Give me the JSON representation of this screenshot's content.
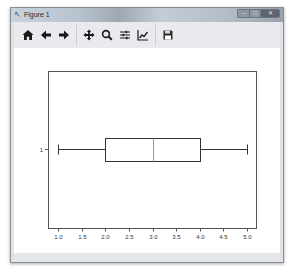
{
  "window": {
    "title": "Figure 1",
    "controls": {
      "minimize": "–",
      "maximize": "□",
      "close": "✕"
    }
  },
  "toolbar": {
    "buttons": [
      {
        "name": "home",
        "icon": "home-icon",
        "group": 0
      },
      {
        "name": "back",
        "icon": "arrow-left-icon",
        "group": 0
      },
      {
        "name": "forward",
        "icon": "arrow-right-icon",
        "group": 0
      },
      {
        "name": "pan",
        "icon": "move-icon",
        "group": 1
      },
      {
        "name": "zoom",
        "icon": "magnifier-icon",
        "group": 1
      },
      {
        "name": "subplots",
        "icon": "sliders-icon",
        "group": 1
      },
      {
        "name": "edit-axis",
        "icon": "line-chart-icon",
        "group": 1
      },
      {
        "name": "save",
        "icon": "floppy-disk-icon",
        "group": 2
      }
    ]
  },
  "colors": {
    "box": "#333333",
    "median": "#999999",
    "whisker": "#333333",
    "axes": "#555555",
    "background": "#ffffff"
  },
  "chart_data": {
    "type": "boxplot",
    "orientation": "horizontal",
    "title": "",
    "xlabel": "",
    "ylabel": "",
    "xlim": [
      0.85,
      5.2
    ],
    "x_ticks": [
      1.0,
      1.5,
      2.0,
      2.5,
      3.0,
      3.5,
      4.0,
      4.5,
      5.0
    ],
    "x_tick_labels": [
      "1.0",
      "1.5",
      "2.0",
      "2.5",
      "3.0",
      "3.5",
      "4.0",
      "4.5",
      "5.0"
    ],
    "y_ticks": [
      1
    ],
    "y_tick_labels": [
      "1"
    ],
    "series": [
      {
        "name": "1",
        "whisker_low": 1.0,
        "q1": 2.0,
        "median": 3.0,
        "q3": 4.0,
        "whisker_high": 5.0
      }
    ],
    "grid": false,
    "legend": false
  }
}
